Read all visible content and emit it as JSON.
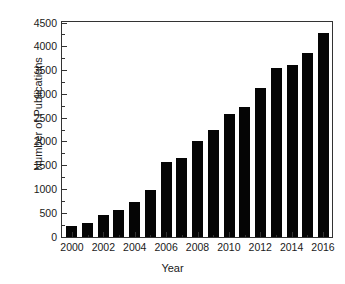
{
  "chart_data": {
    "type": "bar",
    "title": "",
    "xlabel": "Year",
    "ylabel": "Number of Publications",
    "categories": [
      2000,
      2001,
      2002,
      2003,
      2004,
      2005,
      2006,
      2007,
      2008,
      2009,
      2010,
      2011,
      2012,
      2013,
      2014,
      2015,
      2016
    ],
    "values": [
      225,
      300,
      465,
      560,
      730,
      990,
      1570,
      1655,
      2020,
      2255,
      2580,
      2730,
      3140,
      3550,
      3620,
      3880,
      4280
    ],
    "series": [
      {
        "name": "Number of Publications",
        "values": [
          225,
          300,
          465,
          560,
          730,
          990,
          1570,
          1655,
          2020,
          2255,
          2580,
          2730,
          3140,
          3550,
          3620,
          3880,
          4280
        ]
      }
    ],
    "ylim": [
      0,
      4500
    ],
    "xlim": [
      1999.3,
      2016.7
    ],
    "ytick_labels": [
      "0",
      "500",
      "1000",
      "1500",
      "2000",
      "2500",
      "3000",
      "3500",
      "4000",
      "4500"
    ],
    "ytick_values": [
      0,
      500,
      1000,
      1500,
      2000,
      2500,
      3000,
      3500,
      4000,
      4500
    ],
    "xtick_labels": [
      "2000",
      "2002",
      "2004",
      "2006",
      "2008",
      "2010",
      "2012",
      "2014",
      "2016"
    ],
    "xtick_values": [
      2000,
      2002,
      2004,
      2006,
      2008,
      2010,
      2012,
      2014,
      2016
    ],
    "grid": false,
    "legend": null,
    "bar_color": "#050505",
    "axis_color": "#333333",
    "text_color": "#1a1a1a",
    "background_color": "#ffffff"
  }
}
